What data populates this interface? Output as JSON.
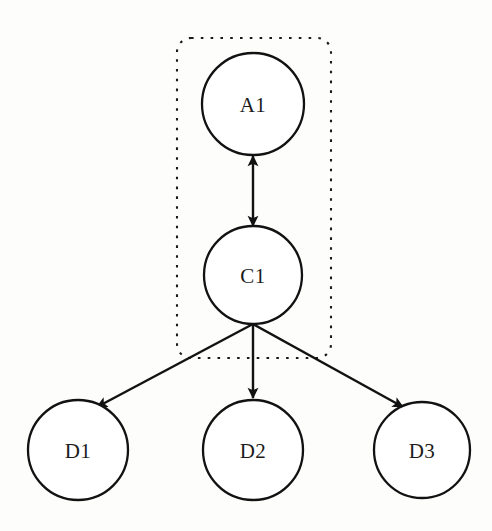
{
  "diagram": {
    "background_color": "#fdfdfc",
    "stroke_color": "#121212",
    "node_fill_color": "#ffffff",
    "nodes": [
      {
        "id": "A1",
        "label": "A1",
        "cx": 253,
        "cy": 104,
        "r": 51
      },
      {
        "id": "C1",
        "label": "C1",
        "cx": 253,
        "cy": 275,
        "r": 49
      },
      {
        "id": "D1",
        "label": "D1",
        "cx": 78,
        "cy": 450,
        "r": 50
      },
      {
        "id": "D2",
        "label": "D2",
        "cx": 253,
        "cy": 450,
        "r": 50
      },
      {
        "id": "D3",
        "label": "D3",
        "cx": 422,
        "cy": 450,
        "r": 48
      }
    ],
    "edges": [
      {
        "id": "A1-C1",
        "from": "C1",
        "to": "A1",
        "arrows": "both",
        "x1": 253,
        "y1": 226,
        "x2": 253,
        "y2": 155
      },
      {
        "id": "C1-D1",
        "from": "C1",
        "to": "D1",
        "arrows": "end",
        "x1": 253,
        "y1": 324,
        "x2": 98,
        "y2": 406
      },
      {
        "id": "C1-D2",
        "from": "C1",
        "to": "D2",
        "arrows": "end",
        "x1": 253,
        "y1": 324,
        "x2": 253,
        "y2": 400
      },
      {
        "id": "C1-D3",
        "from": "C1",
        "to": "D3",
        "arrows": "end",
        "x1": 253,
        "y1": 324,
        "x2": 404,
        "y2": 406
      }
    ],
    "group_box": {
      "id": "group-A1-C1",
      "label": "",
      "style": "dashed",
      "x": 177,
      "y": 38,
      "width": 154,
      "height": 320,
      "corner_radius": 14,
      "contains": [
        "A1",
        "C1"
      ]
    }
  }
}
